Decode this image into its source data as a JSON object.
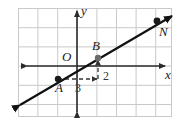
{
  "figure": {
    "width": 182,
    "height": 123,
    "background_color": "#ffffff"
  },
  "grid": {
    "line_color": "#c9c9c9",
    "cell_size_px": 19.2,
    "left_px": 18,
    "top_px": 8,
    "right_px": 172,
    "bottom_px": 117,
    "columns": 8,
    "rows": 6,
    "visible": true
  },
  "axes": {
    "color": "#2b2b2b",
    "x_axis": {
      "label": "x",
      "y_px": 66,
      "arrow_left": true,
      "arrow_right": true
    },
    "y_axis": {
      "label": "y",
      "x_px": 77,
      "arrow_up": true,
      "arrow_down": true
    },
    "origin_label": "O"
  },
  "line": {
    "color": "#111111",
    "width_px": 2.2,
    "arrow_start": true,
    "arrow_end": true,
    "slope_rise": 2,
    "slope_run": 3,
    "slope_value": "2/3"
  },
  "points": [
    {
      "label": "A",
      "x_px": 58,
      "y_px": 79,
      "color": "#1a1a1a",
      "marker": "filled-circle"
    },
    {
      "label": "B",
      "x_px": 98,
      "y_px": 58,
      "color": "#6b6b6b",
      "marker": "filled-circle"
    },
    {
      "label": "N",
      "x_px": 157,
      "y_px": 21,
      "color": "#1a1a1a",
      "marker": "filled-circle"
    }
  ],
  "slope_annotation": {
    "run": {
      "label": "3",
      "color": "#333333",
      "style": "dashed-arrow",
      "from_x_px": 58,
      "to_x_px": 98,
      "y_px": 79
    },
    "rise": {
      "label": "2",
      "color": "#333333",
      "style": "dashed-arrow",
      "x_px": 98,
      "from_y_px": 79,
      "to_y_px": 59
    }
  }
}
